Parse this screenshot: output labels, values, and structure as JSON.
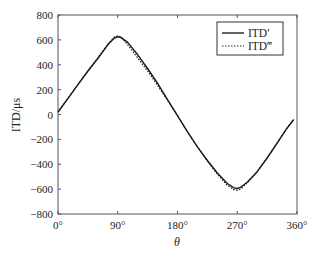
{
  "chart_data": {
    "type": "line",
    "title": "",
    "xlabel": "θ",
    "ylabel": "ITD/μs",
    "xlim": [
      0,
      360
    ],
    "ylim": [
      -800,
      800
    ],
    "xticks": [
      0,
      90,
      180,
      270,
      360
    ],
    "xtick_labels": [
      "0°",
      "90°",
      "180°",
      "270°",
      "360°"
    ],
    "yticks": [
      800,
      600,
      400,
      200,
      0,
      -200,
      -400,
      -600,
      -800
    ],
    "ytick_labels": [
      "800",
      "600",
      "400",
      "200",
      "0",
      "−200",
      "−400",
      "−600",
      "−800"
    ],
    "grid": false,
    "legend_position": "upper right",
    "x": [
      0,
      15,
      30,
      45,
      60,
      75,
      85,
      90,
      95,
      105,
      120,
      135,
      150,
      165,
      180,
      195,
      210,
      225,
      240,
      255,
      265,
      270,
      275,
      285,
      300,
      315,
      330,
      345,
      355
    ],
    "series": [
      {
        "name": "ITD′",
        "style": "solid",
        "values": [
          20,
          130,
          240,
          350,
          450,
          560,
          615,
          625,
          618,
          580,
          480,
          370,
          250,
          120,
          -10,
          -140,
          -260,
          -370,
          -470,
          -555,
          -590,
          -595,
          -585,
          -545,
          -460,
          -350,
          -230,
          -110,
          -40
        ]
      },
      {
        "name": "ITD‴",
        "style": "dotted",
        "values": [
          20,
          130,
          240,
          350,
          455,
          565,
          625,
          632,
          625,
          560,
          455,
          350,
          235,
          115,
          -10,
          -140,
          -260,
          -375,
          -480,
          -570,
          -605,
          -610,
          -600,
          -550,
          -460,
          -350,
          -230,
          -110,
          -40
        ]
      }
    ]
  },
  "legend": {
    "items": [
      {
        "label": "ITD′",
        "style": "solid"
      },
      {
        "label": "ITD‴",
        "style": "dotted"
      }
    ]
  }
}
